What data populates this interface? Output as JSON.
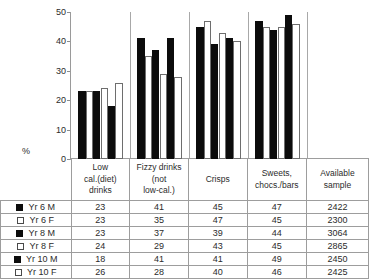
{
  "axis": {
    "ylabel": "%",
    "ticks": [
      "50",
      "40",
      "30",
      "20",
      "10",
      "0"
    ]
  },
  "table": {
    "headers": [
      "Low cal.(diet) drinks",
      "Fizzy drinks (not low-cal.)",
      "Crisps",
      "Sweets, chocs./bars",
      "Available sample"
    ],
    "headers_lines": [
      [
        "Low",
        "cal.(diet)",
        "drinks"
      ],
      [
        "Fizzy drinks",
        "(not",
        "low-cal.)"
      ],
      [
        "Crisps"
      ],
      [
        "Sweets,",
        "chocs./bars"
      ],
      [
        "Available",
        "sample"
      ]
    ],
    "rows": [
      {
        "label": "Yr 6 M",
        "swatch": "black-square-icon",
        "values": [
          "23",
          "41",
          "45",
          "47"
        ],
        "sample": "2422"
      },
      {
        "label": "Yr 6 F",
        "swatch": "white-square-icon",
        "values": [
          "23",
          "35",
          "47",
          "45"
        ],
        "sample": "2300"
      },
      {
        "label": "Yr 8 M",
        "swatch": "black-square-icon",
        "values": [
          "23",
          "37",
          "39",
          "44"
        ],
        "sample": "3064"
      },
      {
        "label": "Yr 8 F",
        "swatch": "white-square-icon",
        "values": [
          "24",
          "29",
          "43",
          "45"
        ],
        "sample": "2865"
      },
      {
        "label": "Yr 10 M",
        "swatch": "black-square-icon",
        "values": [
          "18",
          "41",
          "41",
          "49"
        ],
        "sample": "2450"
      },
      {
        "label": "Yr 10 F",
        "swatch": "white-square-icon",
        "values": [
          "26",
          "28",
          "40",
          "46"
        ],
        "sample": "2425"
      }
    ]
  },
  "colors": {
    "male_bar": "#0c0c0c",
    "female_bar": "#ffffff",
    "female_bar_border": "#6e6e6e",
    "axis": "#9a9a9a",
    "grid_border": "#9d9d9d",
    "text": "#2b2b2b",
    "background": "#ffffff"
  },
  "chart_data": {
    "type": "bar",
    "title": "",
    "subtitle": "",
    "xlabel": "",
    "ylabel": "%",
    "ylim": [
      0,
      50
    ],
    "yticks": [
      0,
      10,
      20,
      30,
      40,
      50
    ],
    "grid": false,
    "legend_position": "table-left-column",
    "categories": [
      "Low cal.(diet) drinks",
      "Fizzy drinks (not low-cal.)",
      "Crisps",
      "Sweets, chocs./bars"
    ],
    "series": [
      {
        "name": "Yr 6 M",
        "fill": "black",
        "values": [
          23,
          41,
          45,
          47
        ],
        "available_sample": 2422
      },
      {
        "name": "Yr 6 F",
        "fill": "white",
        "values": [
          23,
          35,
          47,
          45
        ],
        "available_sample": 2300
      },
      {
        "name": "Yr 8 M",
        "fill": "black",
        "values": [
          23,
          37,
          39,
          44
        ],
        "available_sample": 3064
      },
      {
        "name": "Yr 8 F",
        "fill": "white",
        "values": [
          24,
          29,
          43,
          45
        ],
        "available_sample": 2865
      },
      {
        "name": "Yr 10 M",
        "fill": "black",
        "values": [
          18,
          41,
          41,
          49
        ],
        "available_sample": 2450
      },
      {
        "name": "Yr 10 F",
        "fill": "white",
        "values": [
          26,
          28,
          40,
          46
        ],
        "available_sample": 2425
      }
    ],
    "annotations": [
      "Available sample column has no plotted bars"
    ]
  }
}
